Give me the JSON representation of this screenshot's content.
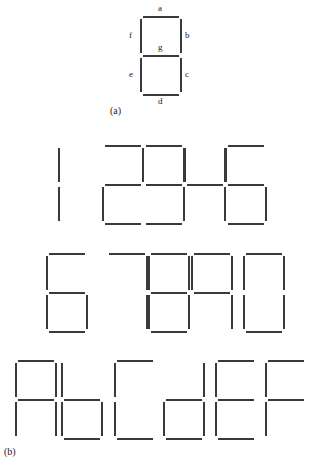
{
  "figure": {
    "caption_a": "(a)",
    "caption_b": "(b)"
  },
  "part_a": {
    "title": "seven-segment display segment naming",
    "segment_labels": {
      "a": "a",
      "b": "b",
      "c": "c",
      "d": "d",
      "e": "e",
      "f": "f",
      "g": "g"
    },
    "all_segments_on": [
      "a",
      "b",
      "c",
      "d",
      "e",
      "f",
      "g"
    ]
  },
  "part_b": {
    "title": "hexadecimal digits rendered on a seven-segment display",
    "rows": [
      {
        "digits": [
          {
            "label": "1",
            "segments": [
              "e",
              "f"
            ],
            "x": 57
          },
          {
            "label": "2",
            "segments": [
              "a",
              "b",
              "g",
              "e",
              "d"
            ],
            "x": 101
          },
          {
            "label": "3",
            "segments": [
              "a",
              "b",
              "g",
              "c",
              "d"
            ],
            "x": 142
          },
          {
            "label": "4",
            "segments": [
              "f",
              "b",
              "g",
              "c"
            ],
            "x": 183
          },
          {
            "label": "5",
            "segments": [
              "a",
              "f",
              "g",
              "c",
              "d"
            ],
            "x": 224
          }
        ]
      },
      {
        "digits": [
          {
            "label": "6",
            "segments": [
              "a",
              "f",
              "g",
              "e",
              "c",
              "d"
            ],
            "x": 45
          },
          {
            "label": "7",
            "segments": [
              "a",
              "b",
              "c"
            ],
            "x": 105
          },
          {
            "label": "8",
            "segments": [
              "a",
              "b",
              "c",
              "d",
              "e",
              "f",
              "g"
            ],
            "x": 147
          },
          {
            "label": "9",
            "segments": [
              "a",
              "b",
              "c",
              "f",
              "g"
            ],
            "x": 190
          },
          {
            "label": "0",
            "segments": [
              "a",
              "b",
              "c",
              "d",
              "e",
              "f"
            ],
            "x": 242
          }
        ]
      },
      {
        "digits": [
          {
            "label": "A",
            "segments": [
              "a",
              "b",
              "c",
              "e",
              "f",
              "g"
            ],
            "x": 14
          },
          {
            "label": "b",
            "segments": [
              "f",
              "g",
              "e",
              "c",
              "d"
            ],
            "x": 60
          },
          {
            "label": "C",
            "segments": [
              "a",
              "f",
              "e",
              "d"
            ],
            "x": 113
          },
          {
            "label": "d",
            "segments": [
              "b",
              "g",
              "e",
              "c",
              "d"
            ],
            "x": 162
          },
          {
            "label": "E",
            "segments": [
              "a",
              "f",
              "g",
              "e",
              "d"
            ],
            "x": 214
          },
          {
            "label": "F",
            "segments": [
              "a",
              "f",
              "g",
              "e"
            ],
            "x": 264
          }
        ]
      }
    ]
  },
  "colors": {
    "segment_on": "#3a3a3a",
    "background": "#ffffff",
    "text": "#1a1a1a"
  }
}
